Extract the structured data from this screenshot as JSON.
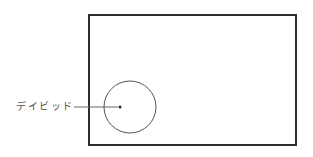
{
  "diagram": {
    "label": "デイビッド",
    "colors": {
      "frame": "#2e2e2e",
      "circle": "#555555",
      "leader": "#666666",
      "dot": "#222222",
      "label": "#555555"
    },
    "frame": {
      "x": 89,
      "y": 15,
      "width": 207,
      "height": 130,
      "stroke_width": 2
    },
    "circle": {
      "cx": 130,
      "cy": 107,
      "r": 26
    },
    "point": {
      "cx": 120,
      "cy": 107,
      "r": 1.5
    },
    "leader": {
      "x1": 74,
      "y1": 107,
      "x2": 118,
      "y2": 107
    }
  }
}
